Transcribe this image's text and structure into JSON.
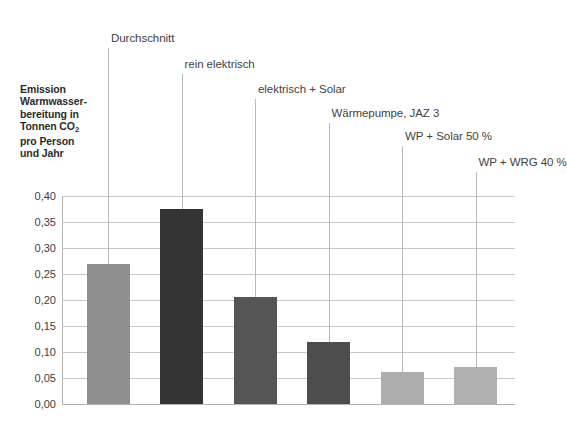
{
  "chart_data": {
    "type": "bar",
    "title": "",
    "ylabel": "Emission Warmwasserbereitung in Tonnen CO₂ pro Person und Jahr",
    "xlabel": "",
    "ylim": [
      0.0,
      0.4
    ],
    "grid": true,
    "legend_position": "none",
    "categories": [
      "Durchschnitt",
      "rein elektrisch",
      "elektrisch + Solar",
      "Wärmepumpe, JAZ 3",
      "WP + Solar 50 %",
      "WP + WRG 40 %"
    ],
    "values": [
      0.27,
      0.375,
      0.205,
      0.12,
      0.062,
      0.072
    ],
    "bar_colors": [
      "#8f8f8f",
      "#343434",
      "#555555",
      "#4d4d4d",
      "#adadad",
      "#b0b0b0"
    ],
    "ytick_labels": [
      "0,40",
      "0,35",
      "0,30",
      "0,25",
      "0,20",
      "0,15",
      "0,10",
      "0,05",
      "0,00"
    ],
    "ytick_values": [
      0.4,
      0.35,
      0.3,
      0.25,
      0.2,
      0.15,
      0.1,
      0.05,
      0.0
    ]
  },
  "axis_title": {
    "line1": "Emission",
    "line2": "Warmwasser-",
    "line3": "bereitung in",
    "line4_pre": "Tonnen CO",
    "line4_sub": "2",
    "line5": "pro Person",
    "line6": "und Jahr"
  },
  "colors": {
    "grid": "#c8c8c8",
    "axis": "#b4b4b4",
    "leader": "#b9b9b9",
    "text": "#3a3a3a",
    "background": "#ffffff"
  }
}
